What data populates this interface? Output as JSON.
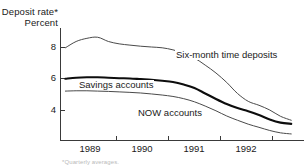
{
  "chart_data": {
    "type": "line",
    "title": "Deposit rate*",
    "subtitle": "Percent",
    "ylabel": "Percent",
    "xlabel": "",
    "ylim": [
      2,
      9.4
    ],
    "xlim": [
      1988.5,
      1993.0
    ],
    "yticks": [
      8,
      6,
      4
    ],
    "ytick_labels": [
      "8",
      "6",
      "4"
    ],
    "xticks": [
      1989,
      1990,
      1991,
      1992
    ],
    "xtick_labels": [
      "1989",
      "1990",
      "1991",
      "1992"
    ],
    "grid": false,
    "legend_position": "inline-annotations",
    "annotations": [
      "Six-month time deposits",
      "Savings accounts",
      "NOW accounts"
    ],
    "footnote": "*Quarterly averages.",
    "x": [
      1988.6,
      1988.8,
      1989.0,
      1989.2,
      1989.4,
      1989.6,
      1989.8,
      1990.0,
      1990.2,
      1990.4,
      1990.6,
      1990.8,
      1991.0,
      1991.2,
      1991.4,
      1991.6,
      1991.8,
      1992.0,
      1992.2,
      1992.4,
      1992.6,
      1992.8
    ],
    "series": [
      {
        "name": "Six-month time deposits",
        "style": "thin",
        "color": "#4a4a4a",
        "values": [
          7.95,
          8.35,
          8.55,
          8.62,
          8.35,
          8.2,
          8.12,
          8.05,
          8.0,
          7.95,
          7.82,
          7.6,
          7.3,
          6.85,
          6.35,
          5.75,
          5.05,
          4.55,
          4.3,
          4.0,
          3.6,
          3.35
        ]
      },
      {
        "name": "Savings accounts",
        "style": "thick",
        "color": "#0d0d0d",
        "values": [
          5.98,
          6.05,
          6.08,
          6.08,
          6.05,
          6.02,
          6.0,
          5.96,
          5.92,
          5.86,
          5.78,
          5.62,
          5.4,
          5.05,
          4.7,
          4.38,
          4.12,
          3.92,
          3.68,
          3.4,
          3.2,
          3.12
        ]
      },
      {
        "name": "NOW accounts",
        "style": "thin",
        "color": "#4a4a4a",
        "values": [
          5.2,
          5.22,
          5.22,
          5.2,
          5.18,
          5.15,
          5.12,
          5.08,
          5.02,
          4.95,
          4.86,
          4.72,
          4.52,
          4.25,
          3.95,
          3.62,
          3.35,
          3.1,
          2.9,
          2.7,
          2.55,
          2.48
        ]
      }
    ]
  },
  "axis": {
    "y_labels": [
      "8",
      "6",
      "4"
    ],
    "x_labels": [
      "1989",
      "1990",
      "1991",
      "1992"
    ]
  },
  "labels": {
    "title_line1": "Deposit rate*",
    "title_line2": "Percent",
    "series_six": "Six-month time deposits",
    "series_savings": "Savings accounts",
    "series_now": "NOW accounts",
    "footnote": "*Quarterly averages."
  }
}
